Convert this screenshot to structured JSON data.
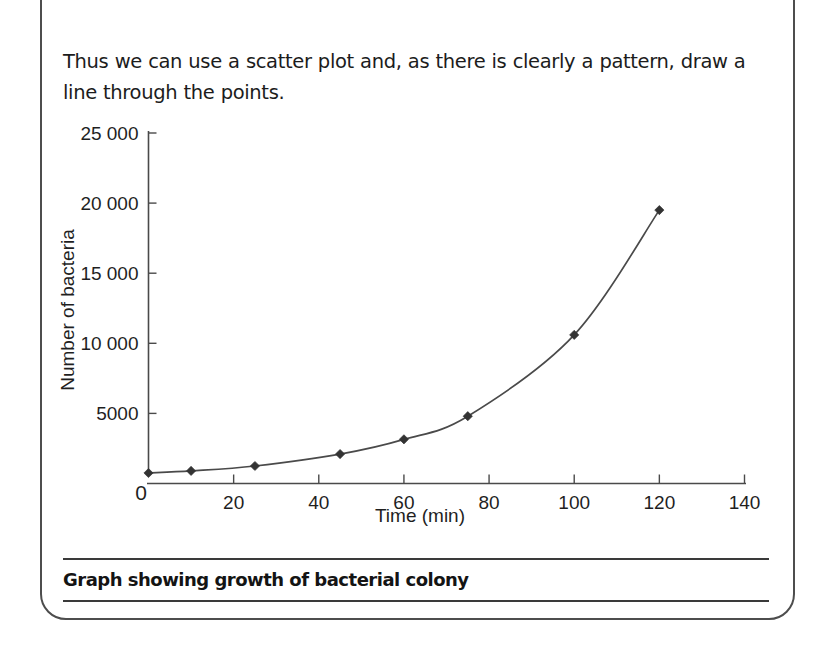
{
  "panel": {
    "border_color": "#4d4d4d"
  },
  "intro": {
    "text": "Thus we can use a scatter plot and, as there is clearly a pattern, draw a line through the points."
  },
  "caption": {
    "text": "Graph showing growth of bacterial colony"
  },
  "chart_data": {
    "type": "scatter",
    "title": "",
    "subtitle": "",
    "xlabel": "Time (min)",
    "ylabel": "Number of bacteria",
    "xlim": [
      0,
      140
    ],
    "ylim": [
      0,
      25000
    ],
    "xticks": [
      0,
      20,
      40,
      60,
      80,
      100,
      120,
      140
    ],
    "xtick_labels": [
      "0",
      "20",
      "40",
      "60",
      "80",
      "100",
      "120",
      "140"
    ],
    "yticks": [
      0,
      5000,
      10000,
      15000,
      20000,
      25000
    ],
    "ytick_labels": [
      "0",
      "5000",
      "10 000",
      "15 000",
      "20 000",
      "25 000"
    ],
    "grid": false,
    "legend": false,
    "origin_label": "0",
    "marker_style": "diamond",
    "line_color": "#4a4a4a",
    "marker_color": "#333333",
    "series": [
      {
        "name": "Number of bacteria",
        "x": [
          0,
          10,
          25,
          45,
          60,
          75,
          100,
          120
        ],
        "y": [
          750,
          900,
          1250,
          2100,
          3150,
          4800,
          10600,
          19500
        ],
        "fitted_curve": true
      }
    ],
    "annotations": []
  }
}
